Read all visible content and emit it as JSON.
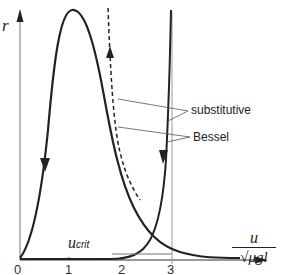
{
  "diagram": {
    "y_axis_label": "r",
    "x_axis_label_numerator": "u",
    "x_axis_label_denominator": "√μgl",
    "x_ticks": [
      "0",
      "1",
      "2",
      "3"
    ],
    "t_axis": {
      "label": "t",
      "tick_label": "0"
    },
    "annotation_ucrit": {
      "main": "u",
      "sub": "crit"
    },
    "legend": {
      "substitutive": "substitutive",
      "bessel": "Bessel"
    }
  }
}
